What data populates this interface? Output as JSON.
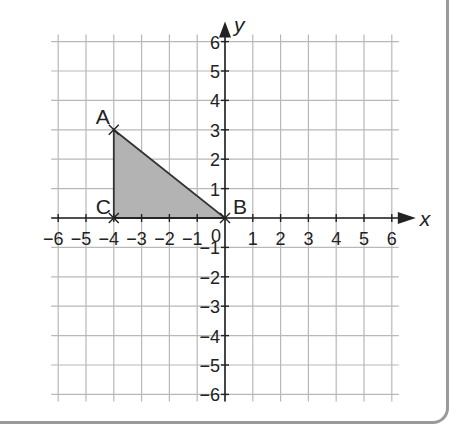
{
  "chart_data": {
    "type": "coordinate-grid",
    "title": "",
    "xlabel": "x",
    "ylabel": "y",
    "xlim": [
      -6,
      6
    ],
    "ylim": [
      -6,
      6
    ],
    "grid": true,
    "x_ticks": [
      "−6",
      "−5",
      "−4",
      "−3",
      "−2",
      "−1",
      "0",
      "1",
      "2",
      "3",
      "4",
      "5",
      "6"
    ],
    "y_ticks": [
      "6",
      "5",
      "4",
      "3",
      "2",
      "1",
      "−1",
      "−2",
      "−3",
      "−4",
      "−5",
      "−6"
    ],
    "origin_label": "0",
    "points": [
      {
        "label": "A",
        "x": -4,
        "y": 3
      },
      {
        "label": "B",
        "x": 0,
        "y": 0
      },
      {
        "label": "C",
        "x": -4,
        "y": 0
      }
    ],
    "shapes": [
      {
        "type": "triangle",
        "vertices": [
          "A",
          "B",
          "C"
        ],
        "fill": "#b3b3b3",
        "stroke": "#333333"
      }
    ]
  },
  "colors": {
    "grid": "#b8b8b8",
    "axis": "#222222",
    "fill": "#b3b3b3",
    "frame": "#9a9a9a"
  }
}
